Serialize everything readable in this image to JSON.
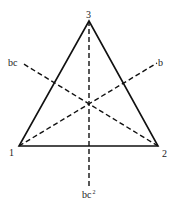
{
  "diagram": {
    "type": "triangle-symmetry-axes",
    "colors": {
      "stroke": "#111111",
      "background": "#ffffff"
    },
    "vertices": [
      {
        "id": "1",
        "label": "1",
        "x": 19,
        "y": 146
      },
      {
        "id": "2",
        "label": "2",
        "x": 158,
        "y": 146
      },
      {
        "id": "3",
        "label": "3",
        "x": 89,
        "y": 21
      }
    ],
    "axes": [
      {
        "id": "vertical",
        "label": "bc",
        "superscript": "2",
        "from": [
          89,
          21
        ],
        "to": [
          89,
          188
        ]
      },
      {
        "id": "diag-up-right",
        "label": "b",
        "from": [
          19,
          146
        ],
        "to": [
          157,
          63
        ]
      },
      {
        "id": "diag-up-left",
        "label": "bc",
        "from": [
          158,
          146
        ],
        "to": [
          22,
          63
        ]
      }
    ],
    "labels": {
      "vertex_1": "1",
      "vertex_2": "2",
      "vertex_3": "3",
      "axis_b": "b",
      "axis_bc": "bc",
      "axis_bc2_base": "bc",
      "axis_bc2_sup": "2"
    }
  }
}
